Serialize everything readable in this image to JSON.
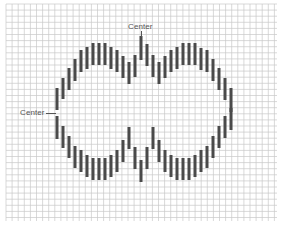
{
  "diagram": {
    "type": "needlepoint-stitch-chart",
    "grid": {
      "x0": 6,
      "y0": 4,
      "x1": 277,
      "y1": 221,
      "spacing": 6.1,
      "line_color": "#c9c9c9",
      "major_every": 0,
      "background": "#ffffff"
    },
    "stitch_color": "#4a4a4a",
    "stitch_width": 3,
    "labels": {
      "top_center": "Center",
      "left_center": "Center"
    },
    "upper_stitches": [
      [
        57,
        88,
        110
      ],
      [
        63,
        78,
        99
      ],
      [
        69,
        68,
        90
      ],
      [
        75,
        59,
        81
      ],
      [
        81,
        50,
        72
      ],
      [
        87,
        47,
        69
      ],
      [
        93,
        43,
        65
      ],
      [
        99,
        43,
        65
      ],
      [
        105,
        43,
        65
      ],
      [
        111,
        47,
        69
      ],
      [
        117,
        50,
        72
      ],
      [
        123,
        56,
        78
      ],
      [
        129,
        62,
        84
      ],
      [
        135,
        55,
        77
      ],
      [
        141,
        36,
        60
      ],
      [
        147,
        44,
        66
      ],
      [
        153,
        55,
        77
      ],
      [
        159,
        62,
        84
      ],
      [
        165,
        56,
        78
      ],
      [
        171,
        50,
        72
      ],
      [
        177,
        47,
        69
      ],
      [
        183,
        43,
        65
      ],
      [
        189,
        43,
        65
      ],
      [
        195,
        43,
        65
      ],
      [
        201,
        48,
        70
      ],
      [
        207,
        50,
        72
      ],
      [
        213,
        59,
        81
      ],
      [
        219,
        68,
        90
      ],
      [
        225,
        78,
        100
      ],
      [
        231,
        88,
        112
      ]
    ],
    "lower_stitches": [
      [
        57,
        116,
        139
      ],
      [
        63,
        126,
        148
      ],
      [
        69,
        136,
        158
      ],
      [
        75,
        146,
        168
      ],
      [
        81,
        150,
        172
      ],
      [
        87,
        155,
        177
      ],
      [
        93,
        158,
        180
      ],
      [
        99,
        158,
        180
      ],
      [
        105,
        158,
        180
      ],
      [
        111,
        155,
        177
      ],
      [
        117,
        150,
        172
      ],
      [
        123,
        140,
        162
      ],
      [
        129,
        127,
        149
      ],
      [
        135,
        147,
        169
      ],
      [
        141,
        160,
        182
      ],
      [
        147,
        147,
        169
      ],
      [
        153,
        127,
        149
      ],
      [
        159,
        140,
        162
      ],
      [
        165,
        150,
        172
      ],
      [
        171,
        155,
        177
      ],
      [
        177,
        158,
        180
      ],
      [
        183,
        158,
        180
      ],
      [
        189,
        158,
        180
      ],
      [
        195,
        155,
        177
      ],
      [
        201,
        150,
        172
      ],
      [
        207,
        146,
        168
      ],
      [
        213,
        136,
        158
      ],
      [
        219,
        126,
        148
      ],
      [
        225,
        116,
        138
      ],
      [
        231,
        108,
        130
      ]
    ]
  }
}
